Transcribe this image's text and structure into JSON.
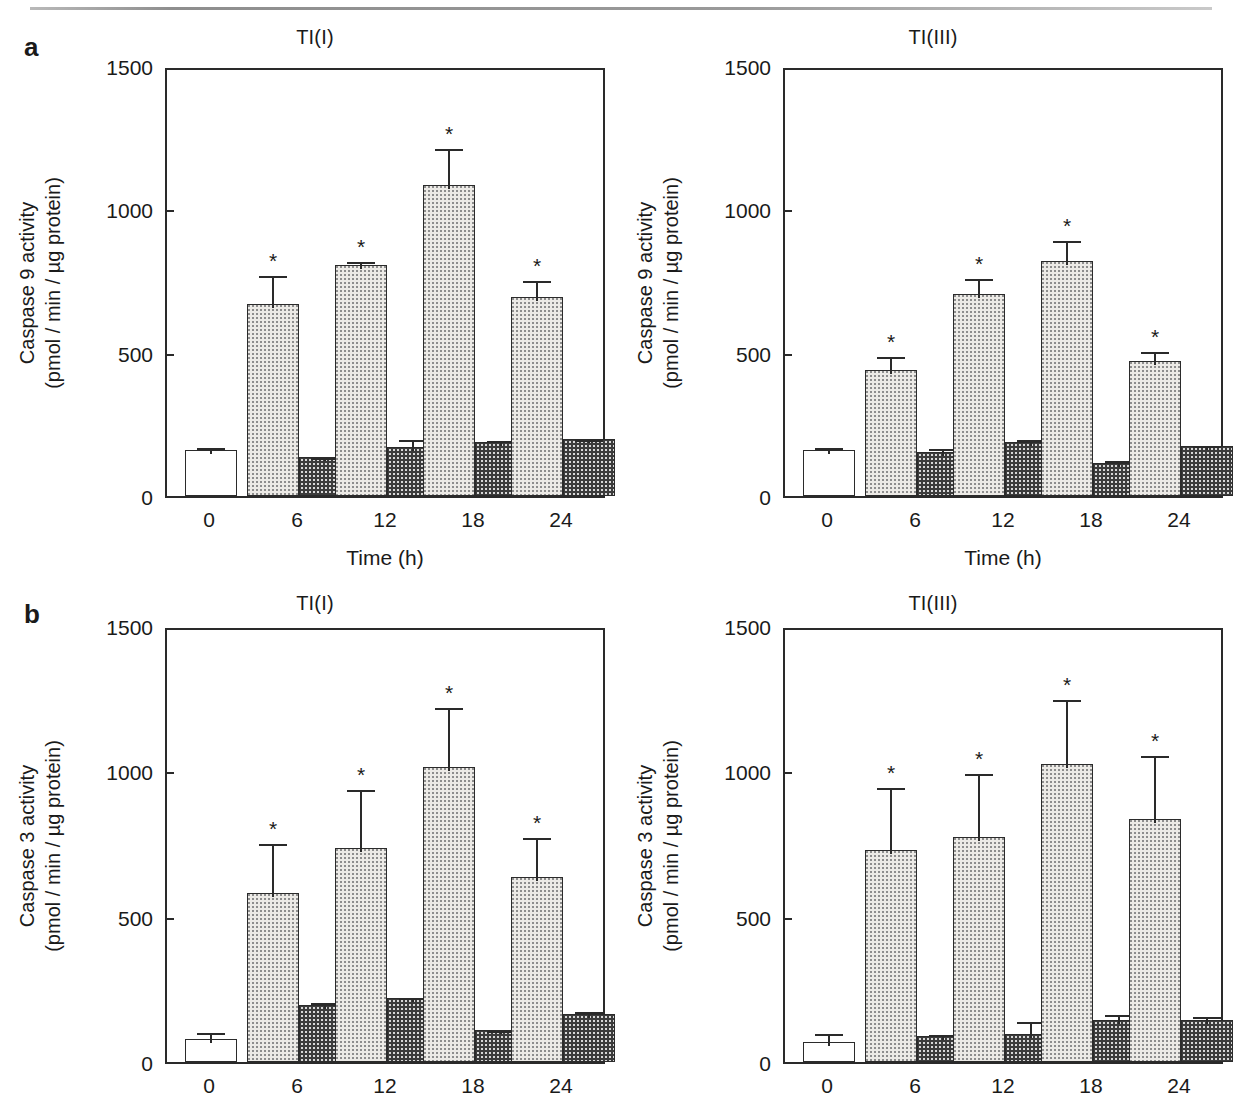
{
  "figure": {
    "panel_a_letter": "a",
    "panel_b_letter": "b"
  },
  "chart_data": [
    {
      "id": "a-left",
      "type": "bar",
      "title": "TI(I)",
      "panel": "a",
      "xlabel": "Time (h)",
      "ylabel_line1": "Caspase 9 activity",
      "ylabel_line2": "(pmol / min / µg protein)",
      "categories": [
        "0",
        "6",
        "12",
        "18",
        "24"
      ],
      "yticks": [
        0,
        500,
        1000,
        1500
      ],
      "ytick_labels": [
        "0",
        "500",
        "1000",
        "1500"
      ],
      "ylim": [
        0,
        1500
      ],
      "grid": false,
      "legend": "none",
      "series": [
        {
          "name": "control-open",
          "style": "open",
          "values": [
            160,
            null,
            null,
            null,
            null
          ],
          "errors": [
            22,
            null,
            null,
            null,
            null
          ],
          "significant": [
            false,
            false,
            false,
            false,
            false
          ]
        },
        {
          "name": "treated-light-dotted",
          "style": "light",
          "values": [
            null,
            670,
            805,
            1085,
            695
          ],
          "errors": [
            null,
            110,
            25,
            140,
            70
          ],
          "significant": [
            false,
            true,
            true,
            true,
            true
          ]
        },
        {
          "name": "treated-dark-checked",
          "style": "dark",
          "values": [
            null,
            135,
            170,
            190,
            200
          ],
          "errors": [
            null,
            10,
            40,
            15,
            8
          ],
          "significant": [
            false,
            false,
            false,
            false,
            false
          ]
        }
      ]
    },
    {
      "id": "a-right",
      "type": "bar",
      "title": "TI(III)",
      "panel": "a",
      "xlabel": "Time (h)",
      "ylabel_line1": "Caspase 9 activity",
      "ylabel_line2": "(pmol / min / µg protein)",
      "categories": [
        "0",
        "6",
        "12",
        "18",
        "24"
      ],
      "yticks": [
        0,
        500,
        1000,
        1500
      ],
      "ytick_labels": [
        "0",
        "500",
        "1000",
        "1500"
      ],
      "ylim": [
        0,
        1500
      ],
      "grid": false,
      "legend": "none",
      "series": [
        {
          "name": "control-open",
          "style": "open",
          "values": [
            160,
            null,
            null,
            null,
            null
          ],
          "errors": [
            20,
            null,
            null,
            null,
            null
          ],
          "significant": [
            false,
            false,
            false,
            false,
            false
          ]
        },
        {
          "name": "treated-light-dotted",
          "style": "light",
          "values": [
            null,
            440,
            705,
            820,
            470
          ],
          "errors": [
            null,
            60,
            65,
            85,
            45
          ],
          "significant": [
            false,
            true,
            true,
            true,
            true
          ]
        },
        {
          "name": "treated-dark-checked",
          "style": "dark",
          "values": [
            null,
            155,
            190,
            115,
            175
          ],
          "errors": [
            null,
            22,
            18,
            22,
            15
          ],
          "significant": [
            false,
            false,
            false,
            false,
            false
          ]
        }
      ]
    },
    {
      "id": "b-left",
      "type": "bar",
      "title": "TI(I)",
      "panel": "b",
      "xlabel": "",
      "ylabel_line1": "Caspase 3 activity",
      "ylabel_line2": "(pmol / min / µg protein)",
      "categories": [
        "0",
        "6",
        "12",
        "18",
        "24"
      ],
      "yticks": [
        0,
        500,
        1000,
        1500
      ],
      "ytick_labels": [
        "0",
        "500",
        "1000",
        "1500"
      ],
      "ylim": [
        0,
        1500
      ],
      "grid": false,
      "legend": "none",
      "series": [
        {
          "name": "control-open",
          "style": "open",
          "values": [
            80,
            null,
            null,
            null,
            null
          ],
          "errors": [
            35,
            null,
            null,
            null,
            null
          ],
          "significant": [
            false,
            false,
            false,
            false,
            false
          ]
        },
        {
          "name": "treated-light-dotted",
          "style": "light",
          "values": [
            null,
            580,
            735,
            1015,
            635
          ],
          "errors": [
            null,
            185,
            215,
            215,
            150
          ],
          "significant": [
            false,
            true,
            true,
            true,
            true
          ]
        },
        {
          "name": "treated-dark-checked",
          "style": "dark",
          "values": [
            null,
            195,
            220,
            110,
            165
          ],
          "errors": [
            null,
            22,
            15,
            12,
            20
          ],
          "significant": [
            false,
            false,
            false,
            false,
            false
          ]
        }
      ]
    },
    {
      "id": "b-right",
      "type": "bar",
      "title": "TI(III)",
      "panel": "b",
      "xlabel": "",
      "ylabel_line1": "Caspase 3 activity",
      "ylabel_line2": "(pmol / min / µg protein)",
      "categories": [
        "0",
        "6",
        "12",
        "18",
        "24"
      ],
      "yticks": [
        0,
        500,
        1000,
        1500
      ],
      "ytick_labels": [
        "0",
        "500",
        "1000",
        "1500"
      ],
      "ylim": [
        0,
        1500
      ],
      "grid": false,
      "legend": "none",
      "series": [
        {
          "name": "control-open",
          "style": "open",
          "values": [
            70,
            null,
            null,
            null,
            null
          ],
          "errors": [
            40,
            null,
            null,
            null,
            null
          ],
          "significant": [
            false,
            false,
            false,
            false,
            false
          ]
        },
        {
          "name": "treated-light-dotted",
          "style": "light",
          "values": [
            null,
            730,
            775,
            1025,
            835
          ],
          "errors": [
            null,
            225,
            230,
            235,
            230
          ],
          "significant": [
            false,
            true,
            true,
            true,
            true
          ]
        },
        {
          "name": "treated-dark-checked",
          "style": "dark",
          "values": [
            null,
            90,
            95,
            145,
            145
          ],
          "errors": [
            null,
            18,
            55,
            30,
            25
          ],
          "significant": [
            false,
            false,
            false,
            false,
            false
          ]
        }
      ]
    }
  ],
  "layout": {
    "charts": [
      {
        "id": "a-left",
        "left": 10,
        "top": 26,
        "width": 610,
        "height": 540,
        "plot": {
          "x": 155,
          "y": 42,
          "w": 440,
          "h": 430
        },
        "significance_marker": "*"
      },
      {
        "id": "a-right",
        "left": 628,
        "top": 26,
        "width": 610,
        "height": 540,
        "plot": {
          "x": 155,
          "y": 42,
          "w": 440,
          "h": 430
        },
        "significance_marker": "*"
      },
      {
        "id": "b-left",
        "left": 10,
        "top": 592,
        "width": 610,
        "height": 520,
        "plot": {
          "x": 155,
          "y": 36,
          "w": 440,
          "h": 436
        },
        "significance_marker": "*"
      },
      {
        "id": "b-right",
        "left": 628,
        "top": 592,
        "width": 610,
        "height": 520,
        "plot": {
          "x": 155,
          "y": 36,
          "w": 440,
          "h": 436
        },
        "significance_marker": "*"
      }
    ]
  },
  "colors": {
    "axis": "#2a2a2a",
    "text": "#1a1a1a",
    "open_bar": "#ffffff",
    "light_bar": "#eceae6",
    "dark_bar": "#3c3c3c",
    "rule": "#9a9a9a"
  }
}
